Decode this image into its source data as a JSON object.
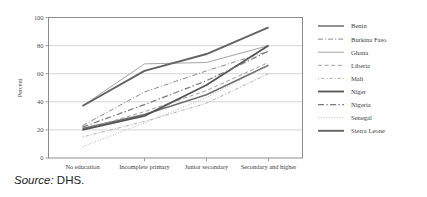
{
  "figure": {
    "source_note_label": "Source",
    "source_note_sep": ":",
    "source_note_value": "DHS."
  },
  "chart_data": {
    "type": "line",
    "title": "",
    "xlabel": "",
    "ylabel": "Percent",
    "ylim": [
      0,
      100
    ],
    "yticks": [
      0,
      20,
      40,
      60,
      80,
      100
    ],
    "grid": true,
    "legend_position": "right",
    "categories": [
      "No education",
      "Incomplete primary",
      "Junior secondary",
      "Secondary and higher"
    ],
    "series": [
      {
        "name": "Benin",
        "values": [
          21,
          31,
          45,
          66
        ],
        "style": "solid",
        "color": "#6e6e6e",
        "width": 1.5
      },
      {
        "name": "Burkina Faso",
        "values": [
          23,
          47,
          62,
          76
        ],
        "style": "dashdot",
        "color": "#8a8a8a",
        "width": 1.0
      },
      {
        "name": "Ghana",
        "values": [
          37,
          67,
          68,
          80
        ],
        "style": "solid",
        "color": "#9a9a9a",
        "width": 0.9
      },
      {
        "name": "Liberia",
        "values": [
          20,
          33,
          48,
          68
        ],
        "style": "dashed",
        "color": "#a0a0a0",
        "width": 1.0
      },
      {
        "name": "Mali",
        "values": [
          15,
          26,
          39,
          60
        ],
        "style": "dotdash",
        "color": "#a8a8a8",
        "width": 0.9
      },
      {
        "name": "Niger",
        "values": [
          20,
          30,
          52,
          80
        ],
        "style": "solid",
        "color": "#555555",
        "width": 1.8
      },
      {
        "name": "Nigeria",
        "values": [
          22,
          38,
          55,
          76
        ],
        "style": "dashdot",
        "color": "#777777",
        "width": 1.2
      },
      {
        "name": "Senegal",
        "values": [
          8,
          25,
          43,
          66
        ],
        "style": "dotted",
        "color": "#b4b4b4",
        "width": 0.9
      },
      {
        "name": "Sierra Leone",
        "values": [
          37,
          62,
          74,
          93
        ],
        "style": "solid",
        "color": "#636363",
        "width": 1.9
      }
    ]
  }
}
